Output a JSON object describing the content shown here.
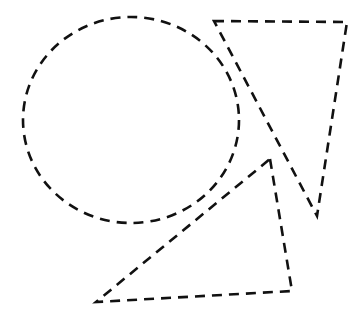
{
  "diagram": {
    "background": "#ffffff",
    "stroke_color": "#111111",
    "line_style": "dashed",
    "shapes": [
      {
        "id": "circle",
        "type": "ellipse",
        "cx": 131,
        "cy": 120,
        "rx": 108,
        "ry": 103
      },
      {
        "id": "inverted-triangle",
        "type": "triangle",
        "points": "214,21 347,22 317,216"
      },
      {
        "id": "lower-triangle",
        "type": "triangle",
        "points": "270,159 292,291 96,302"
      }
    ]
  }
}
